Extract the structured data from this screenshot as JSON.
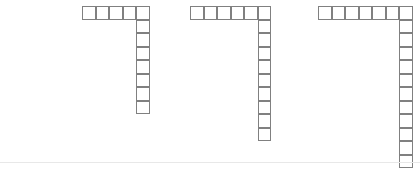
{
  "figure": {
    "background_color": "#ffffff",
    "cell_fill_color": "#ffffff",
    "cell_border_color": "#808080",
    "cell_border_width_px": 1,
    "divider_color": "#e8e8e8",
    "divider_y": 162,
    "canvas_width": 420,
    "canvas_height": 169
  },
  "shapes": [
    {
      "name": "shape-1",
      "label": "Figure 1",
      "form": "L-shape",
      "orientation": "top-row-left-to-right-with-right-column-descending",
      "origin_x": 82,
      "origin_y": 6,
      "cell_size": 13.5,
      "horizontal_cells": 5,
      "vertical_cells": 8,
      "total_cells": 12,
      "corner_shared": true
    },
    {
      "name": "shape-2",
      "label": "Figure 2",
      "form": "L-shape",
      "orientation": "top-row-left-to-right-with-right-column-descending",
      "origin_x": 190,
      "origin_y": 6,
      "cell_size": 13.5,
      "horizontal_cells": 6,
      "vertical_cells": 10,
      "total_cells": 15,
      "corner_shared": true
    },
    {
      "name": "shape-3",
      "label": "Figure 3",
      "form": "L-shape",
      "orientation": "top-row-left-to-right-with-right-column-descending",
      "origin_x": 318,
      "origin_y": 6,
      "cell_size": 13.5,
      "horizontal_cells": 7,
      "vertical_cells": 12,
      "total_cells": 18,
      "corner_shared": true
    }
  ],
  "chart_data": {
    "type": "table",
    "xlabel": "",
    "ylabel": "",
    "categories": [
      "Figure 1",
      "Figure 2",
      "Figure 3"
    ],
    "series": [
      {
        "name": "Horizontal arm (cells)",
        "values": [
          5,
          6,
          7
        ]
      },
      {
        "name": "Vertical arm (cells)",
        "values": [
          8,
          10,
          12
        ]
      },
      {
        "name": "Total squares",
        "values": [
          12,
          15,
          18
        ]
      }
    ],
    "grid": true,
    "legend": "none"
  }
}
